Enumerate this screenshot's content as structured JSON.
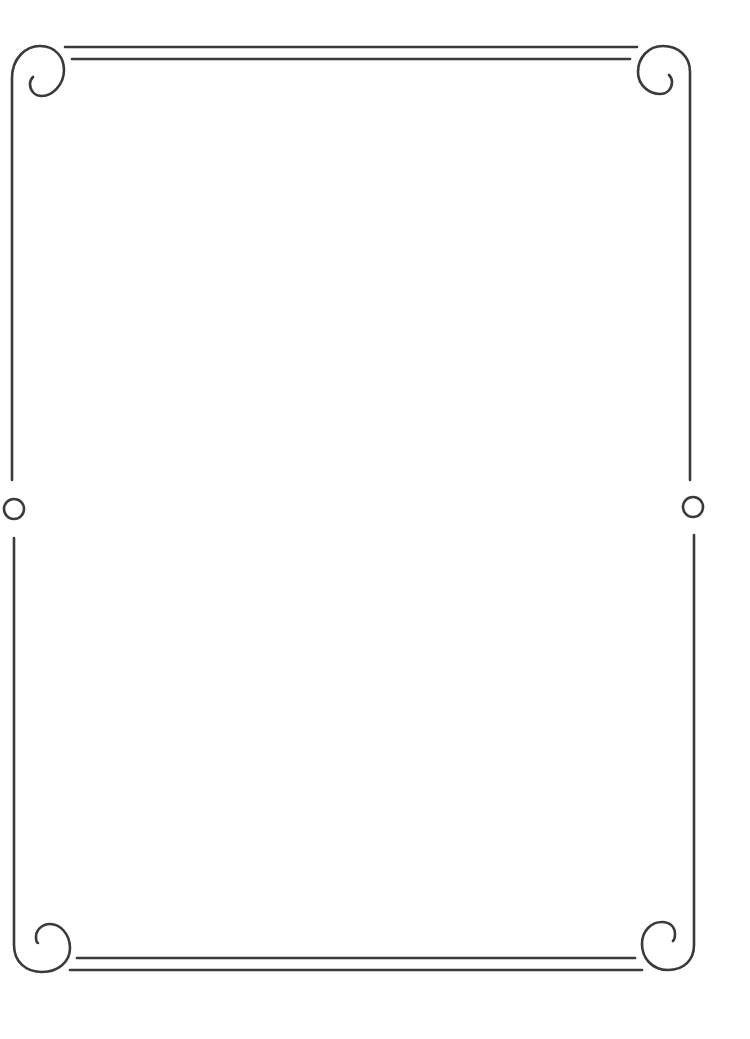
{
  "page": {
    "background_color": "#ffffff",
    "width": 750,
    "height": 1039
  },
  "frame": {
    "style": "decorative border frame with spiral corners",
    "stroke_color": "#3a3a3a",
    "corners": [
      {
        "position": "top-left",
        "ornament": "spiral-icon"
      },
      {
        "position": "top-right",
        "ornament": "spiral-icon"
      },
      {
        "position": "bottom-left",
        "ornament": "spiral-icon"
      },
      {
        "position": "bottom-right",
        "ornament": "spiral-icon"
      }
    ],
    "side_ornaments": [
      {
        "position": "left-middle",
        "ornament": "circle-icon"
      },
      {
        "position": "right-middle",
        "ornament": "circle-icon"
      }
    ],
    "edges": {
      "top": "double-line",
      "bottom": "double-line",
      "left": "single-line",
      "right": "single-line"
    }
  },
  "content": {
    "text": ""
  }
}
